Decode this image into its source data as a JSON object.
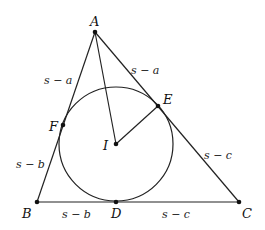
{
  "diagram": {
    "points": {
      "A": {
        "label": "A"
      },
      "B": {
        "label": "B"
      },
      "C": {
        "label": "C"
      },
      "D": {
        "label": "D"
      },
      "E": {
        "label": "E"
      },
      "F": {
        "label": "F"
      },
      "I": {
        "label": "I"
      }
    },
    "segment_labels": {
      "AF": "s − a",
      "AE": "s − a",
      "BF": "s − b",
      "BD": "s − b",
      "CE": "s − c",
      "CD": "s − c"
    }
  }
}
